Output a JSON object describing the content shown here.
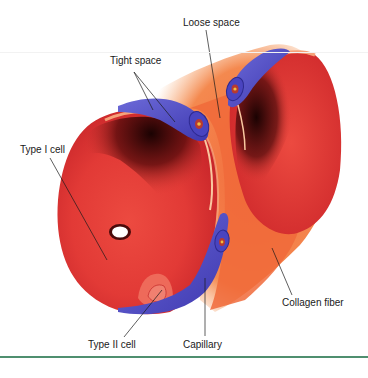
{
  "diagram": {
    "labels": {
      "loose_space": "Loose space",
      "tight_space": "Tight space",
      "type_i_cell": "Type I cell",
      "type_ii_cell": "Type II cell",
      "capillary": "Capillary",
      "collagen_fiber": "Collagen fiber"
    },
    "colors": {
      "tissue_red": "#e8403a",
      "interstitium_orange": "#f06a3a",
      "capillary_blue": "#5a56c8",
      "alveolar_shadow": "#3a0a0a",
      "rule_green": "#4f8f6f"
    }
  }
}
